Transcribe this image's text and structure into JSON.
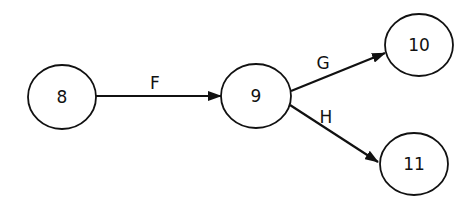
{
  "nodes": [
    {
      "id": "8",
      "label": "8",
      "cx": 62,
      "cy": 97,
      "rx": 34,
      "ry": 32
    },
    {
      "id": "9",
      "label": "9",
      "cx": 256,
      "cy": 96,
      "rx": 35,
      "ry": 32
    },
    {
      "id": "10",
      "label": "10",
      "cx": 419,
      "cy": 45,
      "rx": 34,
      "ry": 31
    },
    {
      "id": "11",
      "label": "11",
      "cx": 414,
      "cy": 164,
      "rx": 34,
      "ry": 31
    }
  ],
  "edges": [
    {
      "id": "F",
      "label": "F",
      "from": "8",
      "to": "9"
    },
    {
      "id": "G",
      "label": "G",
      "from": "9",
      "to": "10"
    },
    {
      "id": "H",
      "label": "H",
      "from": "9",
      "to": "11"
    }
  ],
  "colors": {
    "stroke": "#111111",
    "background": "#ffffff"
  }
}
